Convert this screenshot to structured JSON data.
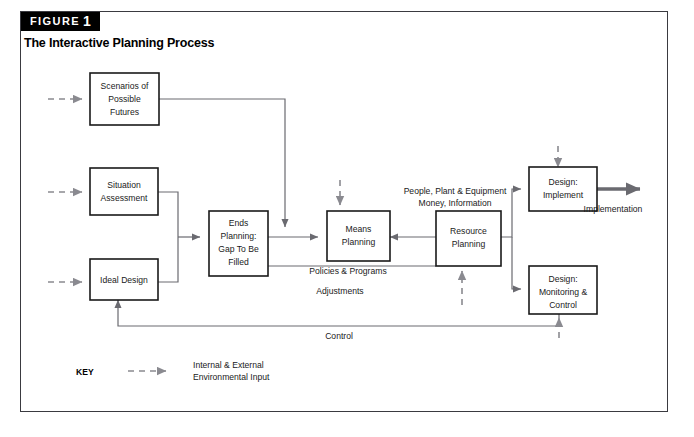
{
  "figure": {
    "tag_label": "FIGURE",
    "tag_number": "1",
    "title": "The Interactive Planning Process"
  },
  "boxes": [
    {
      "id": "scenarios",
      "lines": [
        "Scenarios of",
        "Possible",
        "Futures"
      ]
    },
    {
      "id": "situation",
      "lines": [
        "Situation",
        "Assessment"
      ]
    },
    {
      "id": "ideal",
      "lines": [
        "Ideal Design"
      ]
    },
    {
      "id": "ends",
      "lines": [
        "Ends",
        "Planning:",
        "Gap To Be",
        "Filled"
      ]
    },
    {
      "id": "means",
      "lines": [
        "Means",
        "Planning"
      ]
    },
    {
      "id": "resource",
      "lines": [
        "Resource",
        "Planning"
      ]
    },
    {
      "id": "implement",
      "lines": [
        "Design:",
        "Implement"
      ]
    },
    {
      "id": "monitoring",
      "lines": [
        "Design:",
        "Monitoring &",
        "Control"
      ]
    }
  ],
  "edge_labels": {
    "resources": [
      "People, Plant & Equipment",
      "Money, Information"
    ],
    "policies": "Policies & Programs",
    "adjustments": "Adjustments",
    "control": "Control",
    "implementation": "Implementation"
  },
  "key": {
    "label": "KEY",
    "description": [
      "Internal & External",
      "Environmental Input"
    ]
  },
  "colors": {
    "frame": "#3a3a40",
    "box_stroke": "#1a1a1a",
    "solid_connector": "#6a6a70",
    "dashed_connector": "#8a8a90",
    "tag_background": "#000000",
    "tag_text": "#ffffff",
    "text": "#1a1a1a"
  }
}
